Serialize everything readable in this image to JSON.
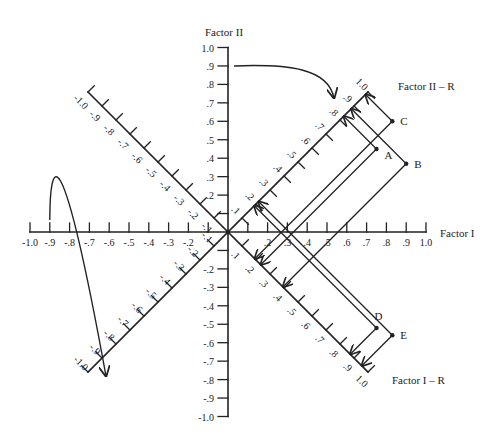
{
  "diagram": {
    "type": "factor-rotation-plot",
    "background": "#ffffff",
    "ink": "#222222",
    "axes": {
      "factor1": {
        "title": "Factor I",
        "ticks": [
          "-1.0",
          "-.9",
          "-.8",
          "-.7",
          "-.6",
          "-.5",
          "-.4",
          "-.3",
          "-.2",
          "-.1",
          ".1",
          ".2",
          ".3",
          ".4",
          ".5",
          ".6",
          ".7",
          ".8",
          ".9",
          "1.0"
        ]
      },
      "factor2": {
        "title": "Factor II",
        "ticks": [
          "1.0",
          ".9",
          ".8",
          ".7",
          ".6",
          ".5",
          ".4",
          ".3",
          ".2",
          ".1",
          "-.1",
          "-.2",
          "-.3",
          "-.4",
          "-.5",
          "-.6",
          "-.7",
          "-.8",
          "-.9",
          "-1.0"
        ]
      },
      "factor1_rotated": {
        "title": "Factor I – R",
        "ticks": [
          ".1",
          ".2",
          ".3",
          ".4",
          ".5",
          ".6",
          ".7",
          ".8",
          ".9",
          "1.0"
        ],
        "neg_ticks": [
          "-.1",
          "-.2",
          "-.3",
          "-.4",
          "-.5",
          "-.6",
          "-.7",
          "-.8",
          "-.9",
          "-1.0"
        ]
      },
      "factor2_rotated": {
        "title": "Factor II – R",
        "ticks": [
          ".1",
          ".2",
          ".3",
          ".4",
          ".5",
          ".6",
          ".7",
          ".8",
          ".9",
          "1.0"
        ],
        "neg_ticks": [
          "-.1",
          "-.2",
          "-.3",
          "-.4",
          "-.5",
          "-.6",
          "-.7",
          "-.8",
          "-.9",
          "-1.0"
        ]
      }
    },
    "points": [
      {
        "label": "A",
        "factor1": 0.75,
        "factor2": 0.45
      },
      {
        "label": "B",
        "factor1": 0.9,
        "factor2": 0.37
      },
      {
        "label": "C",
        "factor1": 0.83,
        "factor2": 0.6
      },
      {
        "label": "D",
        "factor1": 0.75,
        "factor2": -0.52
      },
      {
        "label": "E",
        "factor1": 0.83,
        "factor2": -0.56
      }
    ],
    "rotation_arrows": [
      "upper-left arc toward rotated negative Factor II-R axis",
      "upper arc from Factor II .9 toward Factor II-R .9"
    ]
  }
}
